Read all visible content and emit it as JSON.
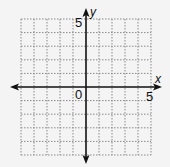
{
  "diagram": {
    "type": "coordinate-grid",
    "x_axis": {
      "label": "x",
      "tick_label": "5",
      "min": -5,
      "max": 5
    },
    "y_axis": {
      "label": "y",
      "tick_label": "5",
      "min": -5,
      "max": 5
    },
    "origin_label": "0",
    "grid": {
      "cells_x": 10,
      "cells_y": 10,
      "style": "dotted"
    },
    "colors": {
      "background": "#f4f4f4",
      "axis": "#111111",
      "grid": "#8a8a8a"
    }
  }
}
